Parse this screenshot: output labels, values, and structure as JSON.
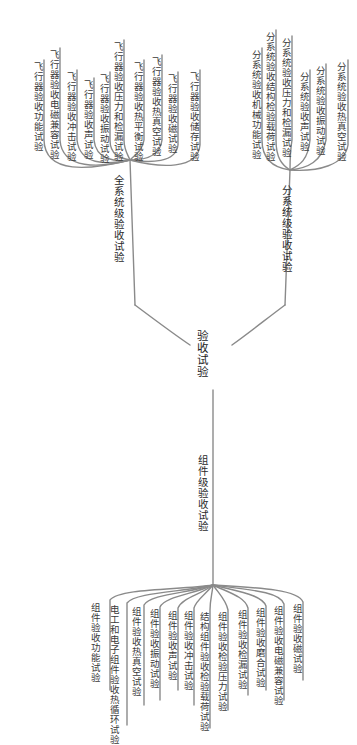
{
  "root": {
    "label": "验收试验"
  },
  "branches": {
    "system": {
      "label": "全系统级验收试验",
      "leaves": [
        "飞行器验收功能试验",
        "飞行器验收电磁兼容试验",
        "飞行器验收冲击试验",
        "飞行器验收声试验",
        "飞行器验收振动试验",
        "飞行器验收压力和检漏试验",
        "飞行器验收热平衡试验",
        "飞行器验收热真空试验",
        "飞行器验收磁试验",
        "飞行器验收储存试验"
      ]
    },
    "subsystem": {
      "label": "分系统级验收试验",
      "leaves": [
        "分系统验收机械功能试验",
        "分系统验收结构检验载荷试验",
        "分系统验收压力和检漏试验",
        "分系统验收声试验",
        "分系统验收振动试验",
        "分系统验收热真空试验"
      ]
    },
    "component": {
      "label": "组件级验收试验",
      "leaves": [
        "组件验收功能试验",
        "电工和电子组件验收热循环试验",
        "组件验收热真空试验",
        "组件验收振动试验",
        "组件验收声试验",
        "组件验收冲击试验",
        "结构组件验收检验载荷试验",
        "组件验收检验压力试验",
        "组件验收检漏试验",
        "组件验收磨合试验",
        "组件验收电磁兼容试验",
        "组件验收磁试验"
      ]
    }
  },
  "colors": {
    "line": "#8a8a8a",
    "text": "#333333",
    "background": "#ffffff"
  }
}
